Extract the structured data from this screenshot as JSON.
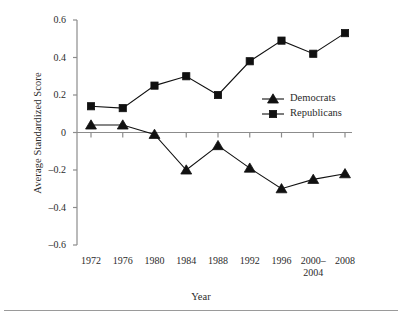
{
  "chart_data": {
    "type": "line",
    "title": "",
    "xlabel": "Year",
    "ylabel": "Average Standardized Score",
    "categories": [
      "1972",
      "1976",
      "1980",
      "1984",
      "1988",
      "1992",
      "1996",
      "2000–2004",
      "2008"
    ],
    "category_lines": [
      [
        "1972"
      ],
      [
        "1976"
      ],
      [
        "1980"
      ],
      [
        "1984"
      ],
      [
        "1988"
      ],
      [
        "1992"
      ],
      [
        "1996"
      ],
      [
        "2000–",
        "2004"
      ],
      [
        "2008"
      ]
    ],
    "ylim": [
      -0.6,
      0.6
    ],
    "yticks": [
      0.6,
      0.4,
      0.2,
      0,
      -0.2,
      -0.4,
      -0.6
    ],
    "ytick_labels": [
      "0.6",
      "0.4",
      "0.2",
      "0",
      "–0.2",
      "–0.4",
      "–0.6"
    ],
    "grid": false,
    "legend_position": "inside-right",
    "zero_line": true,
    "series": [
      {
        "name": "Democrats",
        "marker": "triangle",
        "color": "#111111",
        "values": [
          0.04,
          0.04,
          -0.01,
          -0.2,
          -0.07,
          -0.19,
          -0.3,
          -0.25,
          -0.22
        ]
      },
      {
        "name": "Republicans",
        "marker": "square",
        "color": "#111111",
        "values": [
          0.14,
          0.13,
          0.25,
          0.3,
          0.2,
          0.38,
          0.49,
          0.42,
          0.53
        ]
      }
    ]
  },
  "legend": {
    "entries": [
      {
        "label": "Democrats",
        "marker": "triangle"
      },
      {
        "label": "Republicans",
        "marker": "square"
      }
    ]
  },
  "colors": {
    "line": "#111111",
    "axis": "#8c8c8c",
    "text": "#2b2b2b",
    "rule": "#9a9a9a"
  }
}
